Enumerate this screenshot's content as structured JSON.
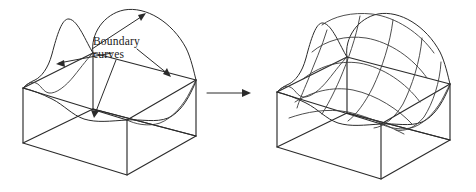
{
  "figure": {
    "background_color": "#ffffff",
    "line_color": "#2b2b2b",
    "text_color": "#1a1a1a",
    "width": 476,
    "height": 192
  },
  "annotation": {
    "label_line_1": "Boundary",
    "label_line_2": "curves",
    "leader_count": 4,
    "leader_targets": [
      "top-back-boundary-curve",
      "left-boundary-curve",
      "front-boundary-curve",
      "right-boundary-curve"
    ]
  },
  "transition": {
    "arrow_name": "transformation-arrow",
    "direction": "right",
    "label": ""
  },
  "panels": [
    {
      "id": "left-panel",
      "name": "boundary-curves-only",
      "caption": "",
      "description": "Box with four boundary curves only",
      "mesh": false
    },
    {
      "id": "right-panel",
      "name": "interpolated-surface-mesh",
      "caption": "",
      "description": "Box with interpolated surface mesh filled in",
      "mesh": true,
      "mesh_rows": 5,
      "mesh_cols": 5
    }
  ]
}
